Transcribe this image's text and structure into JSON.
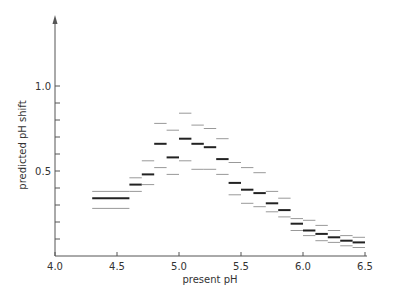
{
  "chart_data": {
    "type": "range-bar",
    "title": "",
    "xlabel": "present pH",
    "ylabel": "predicted pH shift",
    "xlim": [
      4.0,
      6.5
    ],
    "ylim": [
      0.0,
      1.35
    ],
    "x_ticks": [
      "4.0",
      "4.5",
      "5.0",
      "5.5",
      "6.0",
      "6.5"
    ],
    "y_ticks_labeled": [
      "0.5",
      "1.0"
    ],
    "y_minor_tick_step": 0.1,
    "grid": false,
    "legend": null,
    "bins": [
      {
        "x0": 4.3,
        "x1": 4.6,
        "upper": 0.38,
        "mid": 0.34,
        "lower": 0.28
      },
      {
        "x0": 4.6,
        "x1": 4.7,
        "upper": 0.46,
        "mid": 0.42,
        "lower": 0.38
      },
      {
        "x0": 4.7,
        "x1": 4.8,
        "upper": 0.56,
        "mid": 0.48,
        "lower": 0.42
      },
      {
        "x0": 4.8,
        "x1": 4.9,
        "upper": 0.78,
        "mid": 0.66,
        "lower": 0.52
      },
      {
        "x0": 4.9,
        "x1": 5.0,
        "upper": 0.74,
        "mid": 0.58,
        "lower": 0.48
      },
      {
        "x0": 5.0,
        "x1": 5.1,
        "upper": 0.84,
        "mid": 0.69,
        "lower": 0.56
      },
      {
        "x0": 5.1,
        "x1": 5.2,
        "upper": 0.77,
        "mid": 0.66,
        "lower": 0.51
      },
      {
        "x0": 5.2,
        "x1": 5.3,
        "upper": 0.75,
        "mid": 0.64,
        "lower": 0.51
      },
      {
        "x0": 5.3,
        "x1": 5.4,
        "upper": 0.69,
        "mid": 0.57,
        "lower": 0.48
      },
      {
        "x0": 5.4,
        "x1": 5.5,
        "upper": 0.55,
        "mid": 0.43,
        "lower": 0.36
      },
      {
        "x0": 5.5,
        "x1": 5.6,
        "upper": 0.52,
        "mid": 0.39,
        "lower": 0.31
      },
      {
        "x0": 5.6,
        "x1": 5.7,
        "upper": 0.49,
        "mid": 0.37,
        "lower": 0.29
      },
      {
        "x0": 5.7,
        "x1": 5.8,
        "upper": 0.38,
        "mid": 0.31,
        "lower": 0.26
      },
      {
        "x0": 5.8,
        "x1": 5.9,
        "upper": 0.34,
        "mid": 0.27,
        "lower": 0.23
      },
      {
        "x0": 5.9,
        "x1": 6.0,
        "upper": 0.22,
        "mid": 0.19,
        "lower": 0.15
      },
      {
        "x0": 6.0,
        "x1": 6.1,
        "upper": 0.21,
        "mid": 0.15,
        "lower": 0.12
      },
      {
        "x0": 6.1,
        "x1": 6.2,
        "upper": 0.18,
        "mid": 0.13,
        "lower": 0.09
      },
      {
        "x0": 6.2,
        "x1": 6.3,
        "upper": 0.15,
        "mid": 0.11,
        "lower": 0.08
      },
      {
        "x0": 6.3,
        "x1": 6.4,
        "upper": 0.12,
        "mid": 0.09,
        "lower": 0.06
      },
      {
        "x0": 6.4,
        "x1": 6.5,
        "upper": 0.11,
        "mid": 0.08,
        "lower": 0.05
      }
    ],
    "colors": {
      "mid": "#222222",
      "bounds": "#999999",
      "axis": "#555555"
    }
  }
}
